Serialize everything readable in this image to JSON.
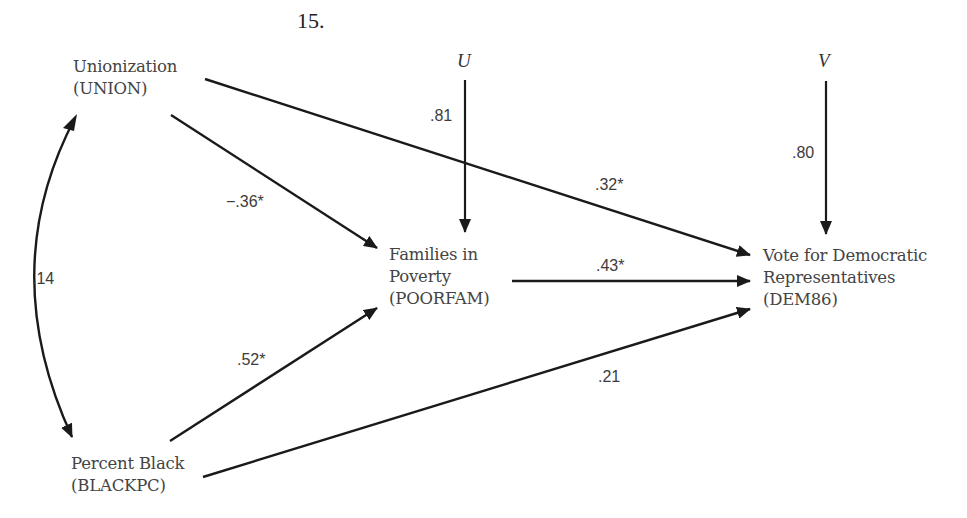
{
  "figure": {
    "number": "15."
  },
  "nodes": {
    "union": {
      "lines": [
        "Unionization",
        "(UNION)"
      ]
    },
    "blackpc": {
      "lines": [
        "Percent Black",
        "(BLACKPC)"
      ]
    },
    "poorfam": {
      "lines": [
        "Families in",
        "Poverty",
        "(POORFAM)"
      ]
    },
    "dem86": {
      "lines": [
        "Vote for Democratic",
        "Representatives",
        "(DEM86)"
      ]
    }
  },
  "error_terms": {
    "u": {
      "label": "U",
      "coefficient": ".81"
    },
    "v": {
      "label": "V",
      "coefficient": ".80"
    }
  },
  "paths": {
    "union_blackpc": {
      "coefficient": ".14",
      "type": "correlation"
    },
    "union_poorfam": {
      "coefficient": "−.36*",
      "type": "direct"
    },
    "union_dem86": {
      "coefficient": ".32*",
      "type": "direct"
    },
    "blackpc_poorfam": {
      "coefficient": ".52*",
      "type": "direct"
    },
    "poorfam_dem86": {
      "coefficient": ".43*",
      "type": "direct"
    },
    "blackpc_dem86": {
      "coefficient": ".21",
      "type": "direct"
    }
  },
  "colors": {
    "line": "#1a1a1a",
    "text": "#444444",
    "background": "#ffffff"
  }
}
